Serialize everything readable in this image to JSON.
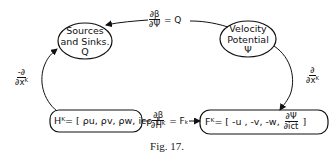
{
  "nodes": {
    "sources_sinks": {
      "line1": "Sources",
      "line2": "and Sinks.",
      "line3": "Q"
    },
    "velocity_potential": {
      "line1": "Velocity",
      "line2": "Potential",
      "line3": "Ψ"
    },
    "h_box": {
      "text": "Hᴷ= [ ρu, ρv, ρw, icρ ]"
    },
    "f_box": {
      "prefix": "Fᴷ= [ -u , -v, -w,",
      "frac_num": "∂Ψ",
      "frac_den": "∂ict",
      "suffix": "]"
    }
  },
  "edges": {
    "top": {
      "num": "∂β",
      "den": "∂Ψ",
      "rhs": "= Q"
    },
    "left": {
      "num": "-∂",
      "den": "∂xᴷ"
    },
    "right": {
      "num": "∂",
      "den": "∂xᴷ"
    },
    "bottom": {
      "num": "∂β",
      "den": "∂Hᴷ",
      "rhs": "= Fₖ"
    }
  },
  "caption": "Fig. 17."
}
